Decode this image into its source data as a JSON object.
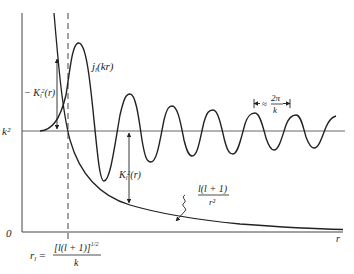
{
  "diagram": {
    "labels": {
      "k_squared": "k²",
      "zero": "0",
      "r_axis": "r",
      "bessel": "j",
      "bessel_sub": "l",
      "bessel_arg": "(kr)",
      "neg_K": "− K",
      "neg_K_sub": "l",
      "neg_K_sup": "2",
      "neg_K_arg": "(r)",
      "pos_K": "K",
      "pos_K_sub": "l",
      "pos_K_sup": "2",
      "pos_K_arg": "(r)",
      "centrifugal_num": "l(l + 1)",
      "centrifugal_den": "r²",
      "wavelength_approx": "≈",
      "wavelength_num": "2π",
      "wavelength_den": "k",
      "turning_point_lhs": "r",
      "turning_point_lhs_sub": "l",
      "turning_point_eq": "=",
      "turning_point_num": "[l(l + 1)]",
      "turning_point_num_sup": "1/2",
      "turning_point_den": "k"
    },
    "colors": {
      "ink": "#222222",
      "background": "#ffffff"
    }
  }
}
